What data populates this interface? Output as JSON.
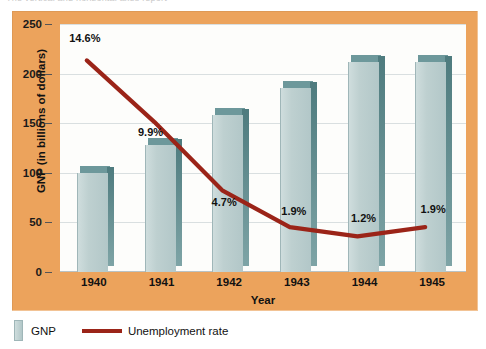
{
  "top_caption": "The vertical and horizontal axes report",
  "legend": {
    "gnp_label": "GNP",
    "unemployment_label": "Unemployment rate",
    "gnp_swatch_color": "#b9cbcb",
    "line_color": "#9b2418"
  },
  "colors": {
    "panel_background": "#eca35c",
    "plot_background": "#fdfdfb",
    "gridline": "#d9dfe0",
    "bar_front": "#b9cbcb",
    "bar_shade": "#6d989b",
    "line": "#9b2418",
    "text": "#111111"
  },
  "chart_data": {
    "type": "bar",
    "title": "",
    "xlabel": "Year",
    "ylabel": "GNP (in billions of dollars)",
    "categories": [
      "1940",
      "1941",
      "1942",
      "1943",
      "1944",
      "1945"
    ],
    "ylim": [
      0,
      250
    ],
    "yticks": [
      0,
      50,
      100,
      150,
      200,
      250
    ],
    "grid": true,
    "legend_position": "bottom-left",
    "series": [
      {
        "name": "GNP",
        "type": "bar",
        "unit": "billions of dollars",
        "values": [
          100,
          128,
          158,
          185,
          212,
          212
        ]
      },
      {
        "name": "Unemployment rate",
        "type": "line",
        "unit": "percent",
        "values": [
          14.6,
          9.9,
          4.7,
          1.9,
          1.2,
          1.9
        ],
        "labels": [
          "14.6%",
          "9.9%",
          "4.7%",
          "1.9%",
          "1.2%",
          "1.9%"
        ],
        "secondary_axis": true
      }
    ]
  }
}
